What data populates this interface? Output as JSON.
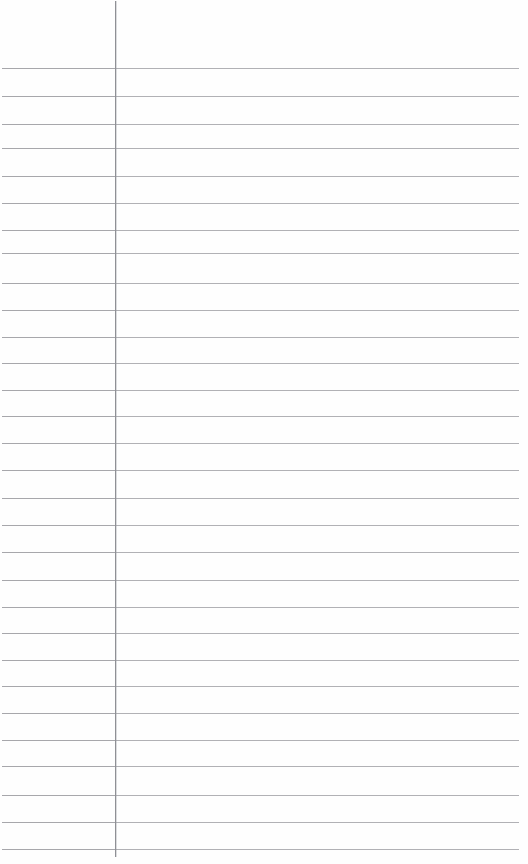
{
  "page": {
    "kind": "ruled-notebook-page",
    "width": 528,
    "height": 864,
    "background_color": "#fefefe",
    "content_text": "",
    "is_blank": true
  },
  "margin_rule": {
    "name": "vertical-margin-line",
    "x": 115,
    "top": 1,
    "bottom": 857,
    "color": "#8f9095",
    "thickness": 1
  },
  "ruling": {
    "name": "horizontal-ruled-lines",
    "line_count": 29,
    "first_line_y": 68,
    "spacing": 27.9,
    "left_x": 2,
    "right_x": 519,
    "color": "#a9a9ac",
    "thickness": 1,
    "line_positions": [
      68,
      96,
      124,
      148,
      176,
      203,
      230,
      253,
      283,
      310,
      337,
      363,
      390,
      416,
      443,
      470,
      498,
      525,
      552,
      580,
      607,
      633,
      660,
      686,
      713,
      740,
      766,
      795,
      822
    ]
  },
  "header_zone": {
    "name": "top-blank-margin",
    "height": 68,
    "text": ""
  },
  "footer_line": {
    "name": "last-ruled-line",
    "y": 849
  },
  "regions": {
    "left_margin_label": "",
    "body_label": ""
  }
}
